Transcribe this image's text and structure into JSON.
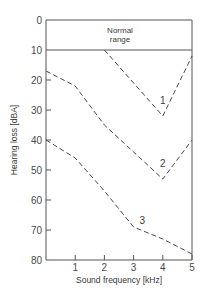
{
  "chart_data": {
    "type": "line",
    "title": "",
    "xlabel": "Sound frequency [kHz]",
    "ylabel": "Hearing loss [dBA]",
    "xlim": [
      0,
      5
    ],
    "ylim": [
      0,
      80
    ],
    "y_inverted": true,
    "xticks": [
      1,
      2,
      3,
      4,
      5
    ],
    "xtick_labels": [
      "1",
      "2",
      "3",
      "4",
      "5"
    ],
    "yticks": [
      0,
      10,
      20,
      30,
      40,
      50,
      60,
      70,
      80
    ],
    "ytick_labels": [
      "0",
      "10",
      "20",
      "30",
      "40",
      "50",
      "60",
      "70",
      "80"
    ],
    "grid": false,
    "legend": "none",
    "annotations": [
      {
        "text_lines": [
          "Normal",
          "range"
        ],
        "region": "0 to 10 dBA band"
      }
    ],
    "reference_lines": [
      {
        "y": 10,
        "style": "solid"
      },
      {
        "y": 0,
        "style": "solid"
      }
    ],
    "series": [
      {
        "name": "1",
        "style": "dashed",
        "x": [
          2,
          4,
          5
        ],
        "values": [
          10,
          32,
          12
        ],
        "label_at": [
          4,
          28
        ]
      },
      {
        "name": "2",
        "style": "dashed",
        "x": [
          0,
          1,
          2,
          3,
          4,
          5
        ],
        "values": [
          17,
          22,
          35,
          44,
          53,
          40
        ],
        "label_at": [
          4,
          49
        ]
      },
      {
        "name": "3",
        "style": "dashed",
        "x": [
          0,
          1,
          2,
          3,
          4,
          5
        ],
        "values": [
          40,
          46,
          57,
          69,
          73,
          78
        ],
        "label_at": [
          3.3,
          68
        ]
      }
    ]
  }
}
